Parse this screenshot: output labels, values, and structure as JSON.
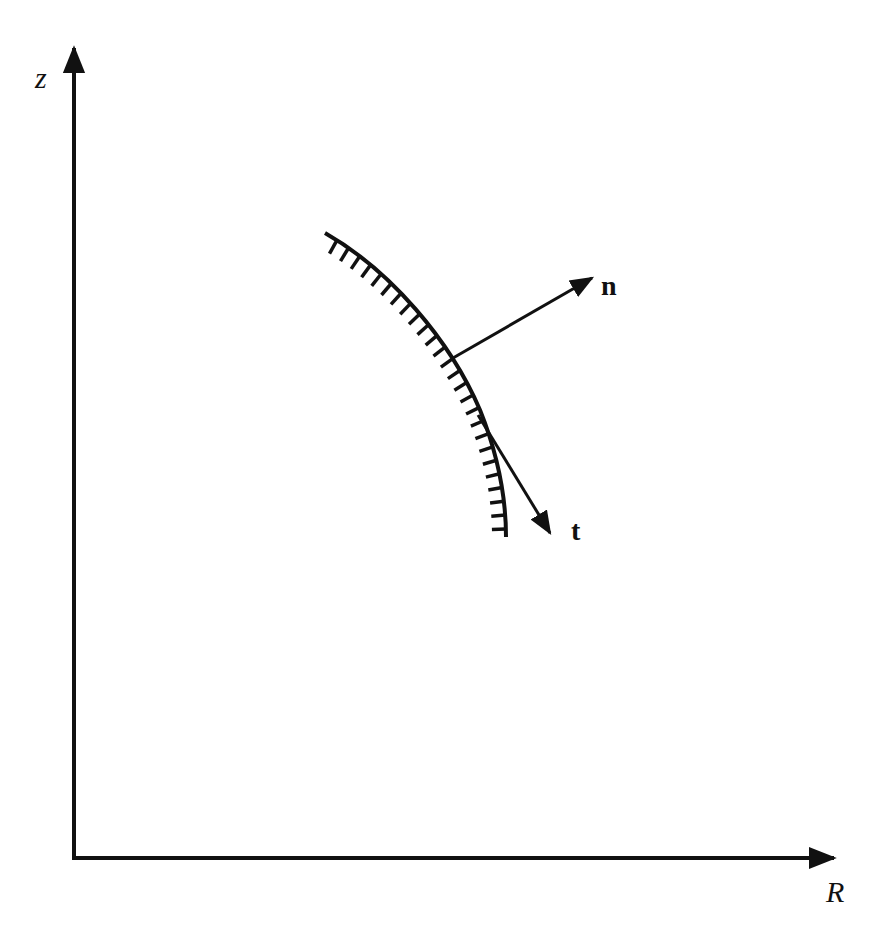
{
  "diagram": {
    "type": "boundary-normal-tangent",
    "colors": {
      "stroke": "#111111",
      "background": "#ffffff"
    },
    "axes": {
      "vertical": {
        "label": "z",
        "origin": [
          74,
          858
        ],
        "end": [
          74,
          44
        ]
      },
      "horizontal": {
        "label": "R",
        "origin": [
          74,
          858
        ],
        "end": [
          838,
          858
        ]
      }
    },
    "boundary_curve": {
      "description": "hatched wall boundary (hatching on inner/left side)",
      "start": [
        325,
        233
      ],
      "end": [
        506,
        537
      ],
      "hatch_count": 26
    },
    "vectors": [
      {
        "name": "n",
        "label": "n",
        "from": [
          453,
          358
        ],
        "to": [
          594,
          277
        ]
      },
      {
        "name": "t",
        "label": "t",
        "from": [
          478,
          415
        ],
        "to": [
          552,
          536
        ]
      }
    ]
  }
}
